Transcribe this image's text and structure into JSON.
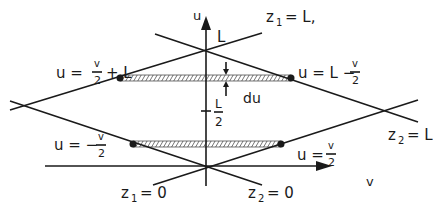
{
  "diagram": {
    "type": "geometry-region",
    "axes": {
      "vertical": {
        "label": "u"
      },
      "horizontal": {
        "label": "v"
      }
    },
    "lines": [
      {
        "label_lhs": "z",
        "label_sub": "1",
        "label_rhs": "= L,"
      },
      {
        "label_lhs": "z",
        "label_sub": "1",
        "label_rhs": "= 0"
      },
      {
        "label_lhs": "z",
        "label_sub": "2",
        "label_rhs": "= 0"
      },
      {
        "label_lhs": "z",
        "label_sub": "2",
        "label_rhs": "= L"
      }
    ],
    "point_labels": {
      "top": "L",
      "half_num": "L",
      "half_den": "2",
      "du": "du"
    },
    "equations": [
      {
        "lhs": "u =",
        "frac_num": "v",
        "frac_den": "2",
        "rhs": "+ L"
      },
      {
        "lhs": "u = L −",
        "frac_num": "v",
        "frac_den": "2",
        "rhs": ""
      },
      {
        "lhs": "u = −",
        "frac_num": "v",
        "frac_den": "2",
        "rhs": ""
      },
      {
        "lhs": "u =",
        "frac_num": "v",
        "frac_den": "2",
        "rhs": ""
      }
    ],
    "colors": {
      "ink": "#1a1a1a",
      "background": "#ffffff"
    }
  }
}
